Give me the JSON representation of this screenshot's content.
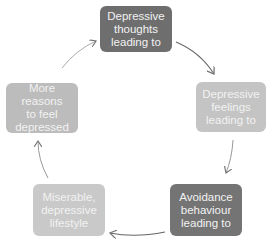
{
  "diagram": {
    "type": "cycle",
    "nodes": [
      {
        "id": "thoughts",
        "lines": [
          "Depressive",
          "thoughts",
          "leading to"
        ],
        "color": "#6e6e6e"
      },
      {
        "id": "feelings",
        "lines": [
          "Depressive",
          "feelings",
          "leading to"
        ],
        "color": "#c4c4c4"
      },
      {
        "id": "avoidance",
        "lines": [
          "Avoidance",
          "behaviour",
          "leading to"
        ],
        "color": "#747474"
      },
      {
        "id": "lifestyle",
        "lines": [
          "Miserable,",
          "depressive",
          "lifestyle"
        ],
        "color": "#c9c9c9"
      },
      {
        "id": "reasons",
        "lines": [
          "More reasons",
          "to feel",
          "depressed"
        ],
        "color": "#bcbcbc"
      }
    ],
    "edges": [
      {
        "from": "thoughts",
        "to": "feelings"
      },
      {
        "from": "feelings",
        "to": "avoidance"
      },
      {
        "from": "avoidance",
        "to": "lifestyle"
      },
      {
        "from": "lifestyle",
        "to": "reasons"
      },
      {
        "from": "reasons",
        "to": "thoughts"
      }
    ],
    "arrow_color": "#888888"
  }
}
